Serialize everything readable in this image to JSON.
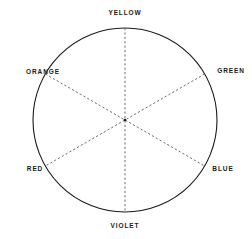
{
  "diagram": {
    "type": "color-wheel",
    "title": "",
    "geometry": {
      "center_x": 125,
      "center_y": 120,
      "radius": 92,
      "sector_count": 6,
      "outline_color": "#1a1a1a",
      "outline_width": 1,
      "divider_style": "dashed",
      "divider_color": "#555555",
      "background_color": "#ffffff"
    },
    "center_dot": {
      "visible": true,
      "color": "#1a1a1a"
    },
    "labels": {
      "yellow": "YELLOW",
      "green": "GREEN",
      "blue": "BLUE",
      "violet": "VIOLET",
      "red": "RED",
      "orange": "ORANGE"
    },
    "label_color": "#1a1a1a",
    "sectors": [
      {
        "name": "yellow",
        "label": "YELLOW",
        "angle_deg": 90,
        "position": "top"
      },
      {
        "name": "green",
        "label": "GREEN",
        "angle_deg": 30,
        "position": "upper-right"
      },
      {
        "name": "blue",
        "label": "BLUE",
        "angle_deg": 330,
        "position": "lower-right"
      },
      {
        "name": "violet",
        "label": "VIOLET",
        "angle_deg": 270,
        "position": "bottom"
      },
      {
        "name": "red",
        "label": "RED",
        "angle_deg": 210,
        "position": "lower-left"
      },
      {
        "name": "orange",
        "label": "ORANGE",
        "angle_deg": 150,
        "position": "upper-left"
      }
    ],
    "dividers": [
      {
        "name": "yellow-violet-axis",
        "from": "yellow",
        "to": "violet"
      },
      {
        "name": "green-red-axis",
        "from": "green",
        "to": "red"
      },
      {
        "name": "orange-blue-axis",
        "from": "orange",
        "to": "blue"
      }
    ]
  }
}
